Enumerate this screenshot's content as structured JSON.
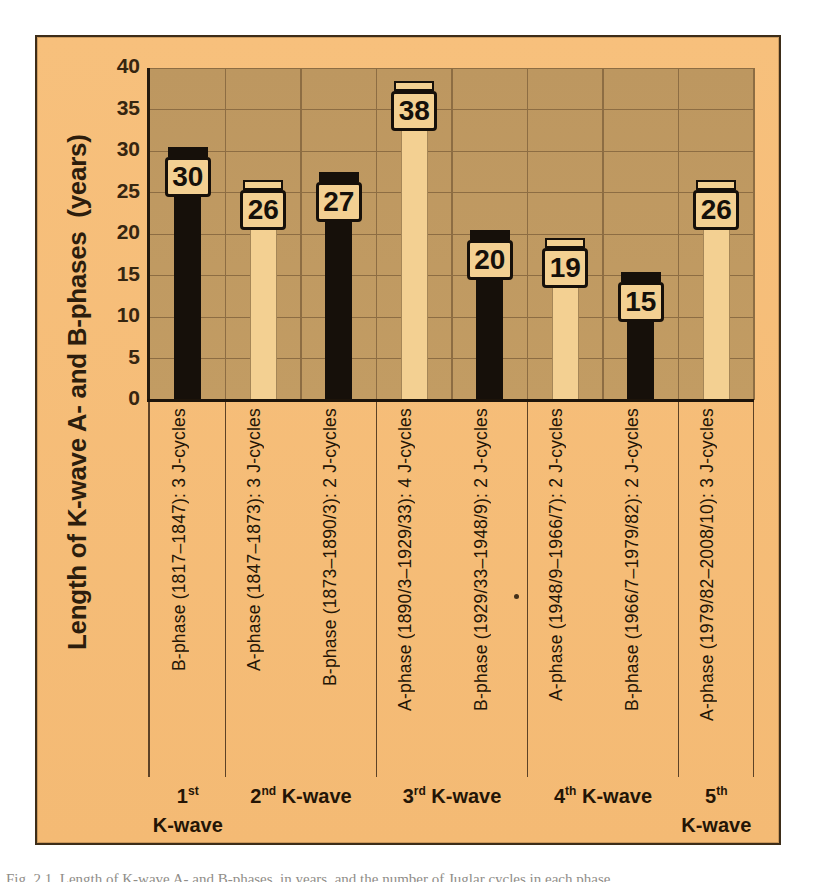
{
  "figure": {
    "y_axis_title": "Length of K-wave A- and B-phases  (years)",
    "caption_partial": "Fig. 2.1. Length of K-wave A- and B-phases, in years, and the number of Juglar cycles in each phase"
  },
  "chart_data": {
    "type": "bar",
    "title": "",
    "xlabel": "",
    "ylabel": "Length of K-wave A- and B-phases (years)",
    "ylim": [
      0,
      40
    ],
    "yticks": [
      40,
      35,
      30,
      25,
      20,
      15,
      10,
      5,
      0
    ],
    "grid": "horizontal major gridlines every 5 years; thin vertical separator between every bar slot",
    "legend": "none (bar fill encodes phase: black = B-phase, light = A-phase)",
    "categories": [
      "B-phase (1817–1847): 3 J-cycles",
      "A-phase (1847–1873): 3 J-cycles",
      "B-phase (1873–1890/3): 2 J-cycles",
      "A-phase (1890/3–1929/33): 4 J-cycles",
      "B-phase (1929/33–1948/9): 2 J-cycles",
      "A-phase (1948/9–1966/7): 2 J-cycles",
      "B-phase (1966/7–1979/82): 2 J-cycles",
      "A-phase (1979/82–2008/10): 3 J-cycles"
    ],
    "values": [
      30,
      26,
      27,
      38,
      20,
      19,
      15,
      26
    ],
    "bars": [
      {
        "label": "B-phase (1817–1847): 3 J-cycles",
        "value": 30,
        "phase": "B",
        "fill": "black"
      },
      {
        "label": "A-phase (1847–1873): 3 J-cycles",
        "value": 26,
        "phase": "A",
        "fill": "light"
      },
      {
        "label": "B-phase (1873–1890/3): 2 J-cycles",
        "value": 27,
        "phase": "B",
        "fill": "black"
      },
      {
        "label": "A-phase (1890/3–1929/33): 4 J-cycles",
        "value": 38,
        "phase": "A",
        "fill": "light"
      },
      {
        "label": "B-phase (1929/33–1948/9): 2 J-cycles",
        "value": 20,
        "phase": "B",
        "fill": "black"
      },
      {
        "label": "A-phase (1948/9–1966/7): 2 J-cycles",
        "value": 19,
        "phase": "A",
        "fill": "light"
      },
      {
        "label": "B-phase (1966/7–1979/82): 2 J-cycles",
        "value": 15,
        "phase": "B",
        "fill": "black"
      },
      {
        "label": "A-phase (1979/82–2008/10): 3 J-cycles",
        "value": 26,
        "phase": "A",
        "fill": "light"
      }
    ],
    "groups": [
      {
        "ordinal": "1",
        "suffix": "st",
        "word": "K-wave",
        "first_bar": 0,
        "last_bar": 0,
        "stacked": true
      },
      {
        "ordinal": "2",
        "suffix": "nd",
        "word": "K-wave",
        "first_bar": 1,
        "last_bar": 2,
        "stacked": false
      },
      {
        "ordinal": "3",
        "suffix": "rd",
        "word": "K-wave",
        "first_bar": 3,
        "last_bar": 4,
        "stacked": false
      },
      {
        "ordinal": "4",
        "suffix": "th",
        "word": "K-wave",
        "first_bar": 5,
        "last_bar": 6,
        "stacked": false
      },
      {
        "ordinal": "5",
        "suffix": "th",
        "word": "K-wave",
        "first_bar": 7,
        "last_bar": 7,
        "stacked": true
      }
    ],
    "colors": {
      "panel_background": "#f6be79",
      "plot_background": "#c09a62",
      "bar_black": "#16100a",
      "bar_light": "#f3d092",
      "gridline": "#8d6d43",
      "axis": "#241a0e",
      "value_box_bg": "#f3d092",
      "value_box_border": "#16100a",
      "group_separator": "#5d4226",
      "text": "#241506",
      "panel_border": "#3d2d19"
    }
  }
}
